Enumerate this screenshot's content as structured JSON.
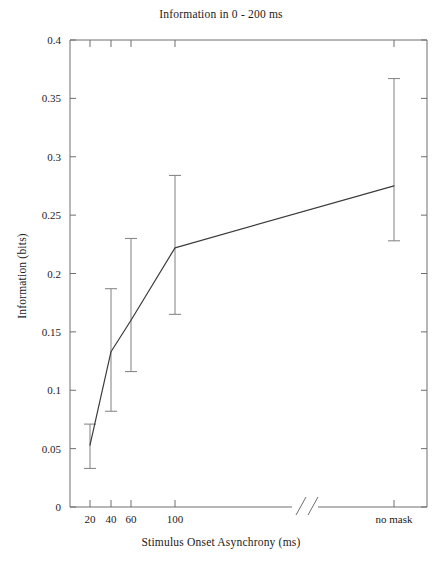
{
  "chart_data": {
    "type": "line",
    "title": "Information in 0 - 200 ms",
    "xlabel": "Stimulus Onset Asynchrony (ms)",
    "ylabel": "Information (bits)",
    "grid": false,
    "legend": null,
    "axis_break": true,
    "axis_break_note": "double slash break on x axis between 100 ms and no mask",
    "ylim": [
      0,
      0.4
    ],
    "yticks": [
      0,
      0.05,
      0.1,
      0.15,
      0.2,
      0.25,
      0.3,
      0.35,
      0.4
    ],
    "ytick_labels": [
      "0",
      "0.05",
      "0.1",
      "0.15",
      "0.2",
      "0.25",
      "0.3",
      "0.35",
      "0.4"
    ],
    "categories": [
      "20",
      "40",
      "60",
      "100",
      "no mask"
    ],
    "xtick_labels": [
      "20",
      "40",
      "60",
      "100",
      "no mask"
    ],
    "series": [
      {
        "name": "Information",
        "values": [
          0.053,
          0.133,
          0.16,
          0.222,
          0.275
        ],
        "error_low": [
          0.033,
          0.082,
          0.116,
          0.165,
          0.228
        ],
        "error_high": [
          0.071,
          0.187,
          0.23,
          0.284,
          0.367
        ]
      }
    ],
    "points": [
      {
        "x_label": "20",
        "y": 0.053,
        "low": 0.033,
        "high": 0.071
      },
      {
        "x_label": "40",
        "y": 0.133,
        "low": 0.082,
        "high": 0.187
      },
      {
        "x_label": "60",
        "y": 0.16,
        "low": 0.116,
        "high": 0.23
      },
      {
        "x_label": "100",
        "y": 0.222,
        "low": 0.165,
        "high": 0.284
      },
      {
        "x_label": "no mask",
        "y": 0.275,
        "low": 0.228,
        "high": 0.367
      }
    ],
    "colors": {
      "line": "#3c3c3c",
      "error_bar": "#8a8a8a",
      "axis": "#6e6e6e",
      "text": "#1a1a1a",
      "background": "#ffffff"
    }
  }
}
